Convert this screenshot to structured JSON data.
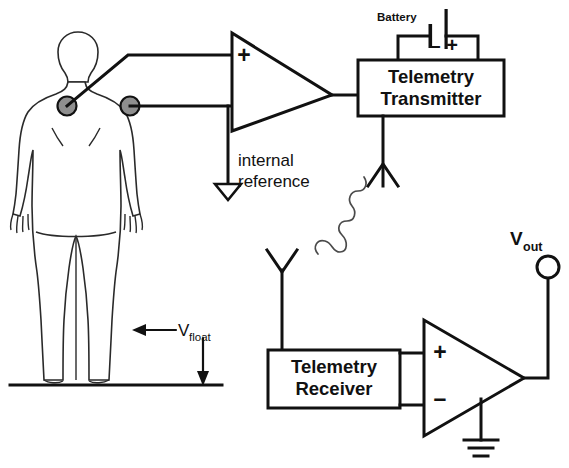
{
  "diagram": {
    "labels": {
      "battery": "Battery",
      "battery_minus": "–",
      "battery_plus": "+",
      "transmitter_line1": "Telemetry",
      "transmitter_line2": "Transmitter",
      "receiver_line1": "Telemetry",
      "receiver_line2": "Receiver",
      "internal_reference_line1": "internal",
      "internal_reference_line2": "reference",
      "amp_in_plus": "+",
      "amp_in_minus": "–",
      "rx_amp_in_plus": "+",
      "rx_amp_in_minus": "–",
      "vout_main": "V",
      "vout_sub": "out",
      "vfloat_main": "V",
      "vfloat_sub": "float"
    },
    "icons": {
      "patient": "human-body-icon",
      "electrode_left": "ecg-electrode-icon",
      "electrode_right": "ecg-electrode-icon",
      "transmit_antenna": "antenna-icon",
      "receive_antenna": "antenna-icon",
      "rf_link": "rf-wave-icon",
      "battery": "battery-icon",
      "floating_ground": "floating-ground-icon",
      "earth_ground": "earth-ground-icon",
      "output_terminal": "output-terminal-icon",
      "input_amplifier": "differential-amplifier-icon",
      "output_amplifier": "differential-amplifier-icon"
    },
    "colors": {
      "ink": "#111111",
      "electrode_fill": "#8f8f8f",
      "body_stroke": "#2a2a2a",
      "rf_wave": "#4a4a4a",
      "background": "#ffffff"
    }
  }
}
